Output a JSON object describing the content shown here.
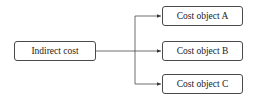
{
  "diagram": {
    "source": {
      "label": "Indirect cost"
    },
    "targets": [
      {
        "label": "Cost object A"
      },
      {
        "label": "Cost object B"
      },
      {
        "label": "Cost object C"
      }
    ],
    "colors": {
      "stroke": "#4a4a4a",
      "background": "#ffffff",
      "text": "#222222"
    }
  }
}
